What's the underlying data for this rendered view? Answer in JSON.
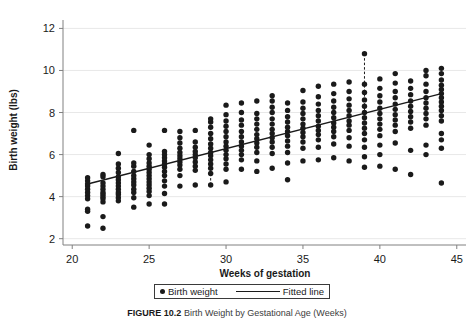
{
  "figure": {
    "caption_label": "FIGURE 10.2",
    "caption_text": "Birth Weight by Gestational Age (Weeks)"
  },
  "legend": {
    "position": "bottom-center",
    "items": [
      {
        "label": "Birth weight",
        "marker": "dot",
        "color": "#1a1a1a"
      },
      {
        "label": "Fitted line",
        "marker": "line",
        "color": "#1a1a1a"
      }
    ]
  },
  "chart_data": {
    "type": "scatter",
    "title": "",
    "xlabel": "Weeks of gestation",
    "ylabel": "Birth weight (lbs)",
    "xlim": [
      19.4,
      45.6
    ],
    "ylim": [
      1.7,
      12.4
    ],
    "xticks": [
      20,
      25,
      30,
      35,
      40,
      45
    ],
    "yticks": [
      2,
      4,
      6,
      8,
      10,
      12
    ],
    "grid": "horizontal",
    "marker_color": "#1a1a1a",
    "line_color": "#1a1a1a",
    "grid_color": "#e8e8e8",
    "fitted_line": {
      "name": "Fitted line",
      "x": [
        21,
        44
      ],
      "y": [
        4.6,
        8.9
      ],
      "slope": 0.187,
      "intercept": 0.673
    },
    "residual_markers": [
      {
        "x": 29,
        "y_point": 4.55,
        "y_fit": 5.1,
        "style": "dashed"
      },
      {
        "x": 39,
        "y_point": 10.8,
        "y_fit": 8.0,
        "style": "dashed"
      }
    ],
    "series": [
      {
        "name": "Birth weight",
        "points": [
          [
            21,
            2.6
          ],
          [
            21,
            3.3
          ],
          [
            21,
            3.4
          ],
          [
            21,
            3.9
          ],
          [
            21,
            4.05
          ],
          [
            21,
            4.2
          ],
          [
            21,
            4.35
          ],
          [
            21,
            4.5
          ],
          [
            21,
            4.6
          ],
          [
            21,
            4.75
          ],
          [
            21,
            4.9
          ],
          [
            22,
            2.5
          ],
          [
            22,
            3.05
          ],
          [
            22,
            3.75
          ],
          [
            22,
            3.9
          ],
          [
            22,
            4.0
          ],
          [
            22,
            4.1
          ],
          [
            22,
            4.2
          ],
          [
            22,
            4.35
          ],
          [
            22,
            4.5
          ],
          [
            22,
            4.65
          ],
          [
            22,
            4.95
          ],
          [
            22,
            5.05
          ],
          [
            23,
            3.8
          ],
          [
            23,
            3.95
          ],
          [
            23,
            4.1
          ],
          [
            23,
            4.2
          ],
          [
            23,
            4.35
          ],
          [
            23,
            4.5
          ],
          [
            23,
            4.65
          ],
          [
            23,
            4.8
          ],
          [
            23,
            4.95
          ],
          [
            23,
            5.15
          ],
          [
            23,
            5.35
          ],
          [
            23,
            5.55
          ],
          [
            23,
            6.05
          ],
          [
            24,
            3.5
          ],
          [
            24,
            3.95
          ],
          [
            24,
            4.2
          ],
          [
            24,
            4.35
          ],
          [
            24,
            4.55
          ],
          [
            24,
            4.7
          ],
          [
            24,
            4.85
          ],
          [
            24,
            5.0
          ],
          [
            24,
            5.2
          ],
          [
            24,
            5.45
          ],
          [
            24,
            5.6
          ],
          [
            24,
            7.15
          ],
          [
            25,
            3.65
          ],
          [
            25,
            4.05
          ],
          [
            25,
            4.25
          ],
          [
            25,
            4.4
          ],
          [
            25,
            4.55
          ],
          [
            25,
            4.7
          ],
          [
            25,
            4.85
          ],
          [
            25,
            5.0
          ],
          [
            25,
            5.15
          ],
          [
            25,
            5.3
          ],
          [
            25,
            5.45
          ],
          [
            25,
            5.6
          ],
          [
            25,
            5.8
          ],
          [
            25,
            6.0
          ],
          [
            25,
            6.45
          ],
          [
            26,
            3.65
          ],
          [
            26,
            4.15
          ],
          [
            26,
            4.5
          ],
          [
            26,
            4.75
          ],
          [
            26,
            5.0
          ],
          [
            26,
            5.2
          ],
          [
            26,
            5.4
          ],
          [
            26,
            5.55
          ],
          [
            26,
            5.7
          ],
          [
            26,
            5.85
          ],
          [
            26,
            6.0
          ],
          [
            26,
            6.15
          ],
          [
            26,
            7.15
          ],
          [
            27,
            4.5
          ],
          [
            27,
            5.0
          ],
          [
            27,
            5.3
          ],
          [
            27,
            5.5
          ],
          [
            27,
            5.65
          ],
          [
            27,
            5.8
          ],
          [
            27,
            5.95
          ],
          [
            27,
            6.1
          ],
          [
            27,
            6.3
          ],
          [
            27,
            6.55
          ],
          [
            27,
            6.8
          ],
          [
            27,
            7.1
          ],
          [
            28,
            4.55
          ],
          [
            28,
            5.25
          ],
          [
            28,
            5.45
          ],
          [
            28,
            5.65
          ],
          [
            28,
            5.85
          ],
          [
            28,
            6.0
          ],
          [
            28,
            6.15
          ],
          [
            28,
            6.35
          ],
          [
            28,
            6.6
          ],
          [
            28,
            7.15
          ],
          [
            29,
            4.55
          ],
          [
            29,
            5.1
          ],
          [
            29,
            5.35
          ],
          [
            29,
            5.55
          ],
          [
            29,
            5.75
          ],
          [
            29,
            5.95
          ],
          [
            29,
            6.1
          ],
          [
            29,
            6.3
          ],
          [
            29,
            6.5
          ],
          [
            29,
            6.75
          ],
          [
            29,
            7.0
          ],
          [
            29,
            7.3
          ],
          [
            29,
            7.55
          ],
          [
            29,
            7.7
          ],
          [
            30,
            4.7
          ],
          [
            30,
            5.3
          ],
          [
            30,
            5.55
          ],
          [
            30,
            5.8
          ],
          [
            30,
            6.0
          ],
          [
            30,
            6.2
          ],
          [
            30,
            6.4
          ],
          [
            30,
            6.6
          ],
          [
            30,
            6.85
          ],
          [
            30,
            7.1
          ],
          [
            30,
            7.35
          ],
          [
            30,
            7.6
          ],
          [
            30,
            7.9
          ],
          [
            30,
            8.35
          ],
          [
            31,
            5.3
          ],
          [
            31,
            5.75
          ],
          [
            31,
            6.0
          ],
          [
            31,
            6.2
          ],
          [
            31,
            6.4
          ],
          [
            31,
            6.6
          ],
          [
            31,
            6.85
          ],
          [
            31,
            7.1
          ],
          [
            31,
            7.4
          ],
          [
            31,
            7.65
          ],
          [
            31,
            8.0
          ],
          [
            31,
            8.45
          ],
          [
            32,
            5.2
          ],
          [
            32,
            5.7
          ],
          [
            32,
            6.1
          ],
          [
            32,
            6.35
          ],
          [
            32,
            6.55
          ],
          [
            32,
            6.75
          ],
          [
            32,
            6.95
          ],
          [
            32,
            7.2
          ],
          [
            32,
            7.45
          ],
          [
            32,
            7.7
          ],
          [
            32,
            7.95
          ],
          [
            32,
            8.55
          ],
          [
            33,
            5.35
          ],
          [
            33,
            6.05
          ],
          [
            33,
            6.35
          ],
          [
            33,
            6.6
          ],
          [
            33,
            6.8
          ],
          [
            33,
            7.0
          ],
          [
            33,
            7.2
          ],
          [
            33,
            7.45
          ],
          [
            33,
            7.7
          ],
          [
            33,
            8.0
          ],
          [
            33,
            8.25
          ],
          [
            33,
            8.55
          ],
          [
            33,
            8.8
          ],
          [
            34,
            4.8
          ],
          [
            34,
            5.6
          ],
          [
            34,
            6.1
          ],
          [
            34,
            6.4
          ],
          [
            34,
            6.65
          ],
          [
            34,
            6.9
          ],
          [
            34,
            7.1
          ],
          [
            34,
            7.3
          ],
          [
            34,
            7.55
          ],
          [
            34,
            7.8
          ],
          [
            34,
            8.1
          ],
          [
            34,
            8.45
          ],
          [
            35,
            5.7
          ],
          [
            35,
            6.3
          ],
          [
            35,
            6.6
          ],
          [
            35,
            6.85
          ],
          [
            35,
            7.05
          ],
          [
            35,
            7.25
          ],
          [
            35,
            7.45
          ],
          [
            35,
            7.7
          ],
          [
            35,
            7.95
          ],
          [
            35,
            8.2
          ],
          [
            35,
            8.5
          ],
          [
            35,
            9.05
          ],
          [
            36,
            5.75
          ],
          [
            36,
            6.35
          ],
          [
            36,
            6.7
          ],
          [
            36,
            6.95
          ],
          [
            36,
            7.15
          ],
          [
            36,
            7.35
          ],
          [
            36,
            7.6
          ],
          [
            36,
            7.85
          ],
          [
            36,
            8.1
          ],
          [
            36,
            8.4
          ],
          [
            36,
            8.75
          ],
          [
            36,
            9.25
          ],
          [
            37,
            5.85
          ],
          [
            37,
            6.5
          ],
          [
            37,
            6.85
          ],
          [
            37,
            7.1
          ],
          [
            37,
            7.3
          ],
          [
            37,
            7.5
          ],
          [
            37,
            7.75
          ],
          [
            37,
            8.0
          ],
          [
            37,
            8.25
          ],
          [
            37,
            8.55
          ],
          [
            37,
            8.9
          ],
          [
            37,
            9.35
          ],
          [
            38,
            5.7
          ],
          [
            38,
            6.4
          ],
          [
            38,
            6.8
          ],
          [
            38,
            7.15
          ],
          [
            38,
            7.4
          ],
          [
            38,
            7.6
          ],
          [
            38,
            7.85
          ],
          [
            38,
            8.1
          ],
          [
            38,
            8.35
          ],
          [
            38,
            8.65
          ],
          [
            38,
            9.0
          ],
          [
            38,
            9.45
          ],
          [
            39,
            5.4
          ],
          [
            39,
            5.9
          ],
          [
            39,
            6.35
          ],
          [
            39,
            6.7
          ],
          [
            39,
            7.0
          ],
          [
            39,
            7.25
          ],
          [
            39,
            7.5
          ],
          [
            39,
            7.75
          ],
          [
            39,
            8.0
          ],
          [
            39,
            8.3
          ],
          [
            39,
            8.6
          ],
          [
            39,
            8.95
          ],
          [
            39,
            9.35
          ],
          [
            39,
            10.8
          ],
          [
            40,
            5.45
          ],
          [
            40,
            6.0
          ],
          [
            40,
            6.45
          ],
          [
            40,
            6.9
          ],
          [
            40,
            7.2
          ],
          [
            40,
            7.45
          ],
          [
            40,
            7.7
          ],
          [
            40,
            7.95
          ],
          [
            40,
            8.2
          ],
          [
            40,
            8.5
          ],
          [
            40,
            8.8
          ],
          [
            40,
            9.15
          ],
          [
            40,
            9.6
          ],
          [
            41,
            5.3
          ],
          [
            41,
            6.55
          ],
          [
            41,
            7.1
          ],
          [
            41,
            7.4
          ],
          [
            41,
            7.65
          ],
          [
            41,
            7.9
          ],
          [
            41,
            8.15
          ],
          [
            41,
            8.4
          ],
          [
            41,
            8.7
          ],
          [
            41,
            9.0
          ],
          [
            41,
            9.4
          ],
          [
            41,
            9.85
          ],
          [
            42,
            5.05
          ],
          [
            42,
            6.2
          ],
          [
            42,
            7.25
          ],
          [
            42,
            7.55
          ],
          [
            42,
            7.8
          ],
          [
            42,
            8.05
          ],
          [
            42,
            8.3
          ],
          [
            42,
            8.55
          ],
          [
            42,
            8.85
          ],
          [
            42,
            9.15
          ],
          [
            42,
            9.5
          ],
          [
            43,
            6.0
          ],
          [
            43,
            6.45
          ],
          [
            43,
            7.4
          ],
          [
            43,
            7.7
          ],
          [
            43,
            7.95
          ],
          [
            43,
            8.2
          ],
          [
            43,
            8.45
          ],
          [
            43,
            8.7
          ],
          [
            43,
            9.0
          ],
          [
            43,
            9.35
          ],
          [
            43,
            9.75
          ],
          [
            43,
            10.0
          ],
          [
            44,
            4.65
          ],
          [
            44,
            6.3
          ],
          [
            44,
            6.7
          ],
          [
            44,
            7.0
          ],
          [
            44,
            7.6
          ],
          [
            44,
            7.85
          ],
          [
            44,
            8.1
          ],
          [
            44,
            8.3
          ],
          [
            44,
            8.5
          ],
          [
            44,
            8.7
          ],
          [
            44,
            8.9
          ],
          [
            44,
            9.1
          ],
          [
            44,
            9.3
          ],
          [
            44,
            9.55
          ],
          [
            44,
            9.85
          ],
          [
            44,
            10.1
          ]
        ]
      }
    ]
  }
}
